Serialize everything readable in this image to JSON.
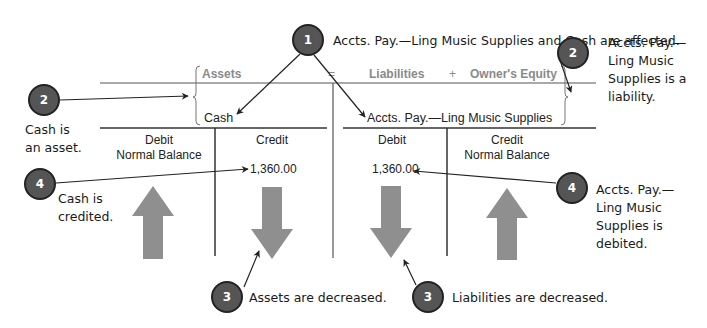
{
  "equation": {
    "assets_label": "Assets",
    "equals_sign": "=",
    "liabilities_label": "Liabilities",
    "plus_sign": "+",
    "equity_label": "Owner's Equity"
  },
  "accounts": {
    "left": {
      "name": "Cash",
      "debit_header": "Debit",
      "debit_subheader": "Normal Balance",
      "credit_header": "Credit",
      "credit_subheader": "",
      "credit_amount": "1,360.00",
      "debit_arrow": "up",
      "credit_arrow": "down"
    },
    "right": {
      "name": "Accts. Pay.—Ling Music Supplies",
      "debit_header": "Debit",
      "debit_subheader": "",
      "credit_header": "Credit",
      "credit_subheader": "Normal Balance",
      "debit_amount": "1,360.00",
      "debit_arrow": "down",
      "credit_arrow": "up"
    }
  },
  "callouts": {
    "step1": {
      "number": "1",
      "text": "Accts. Pay.—Ling Music Supplies and Cash are affected."
    },
    "step2_left": {
      "number": "2",
      "lines": [
        "Cash is",
        "an asset."
      ]
    },
    "step2_right": {
      "number": "2",
      "lines": [
        "Accts. Pay.—",
        "Ling Music",
        "Supplies is a",
        "liability."
      ]
    },
    "step3_left": {
      "number": "3",
      "text": "Assets are decreased."
    },
    "step3_right": {
      "number": "3",
      "text": "Liabilities are decreased."
    },
    "step4_left": {
      "number": "4",
      "lines": [
        "Cash is",
        "credited."
      ]
    },
    "step4_right": {
      "number": "4",
      "lines": [
        "Accts. Pay.—",
        "Ling Music",
        "Supplies is",
        "debited."
      ]
    }
  },
  "colors": {
    "badge_fill": "#555555",
    "arrow_fill": "#8f8f8f",
    "header_text": "#8a8a8a"
  }
}
